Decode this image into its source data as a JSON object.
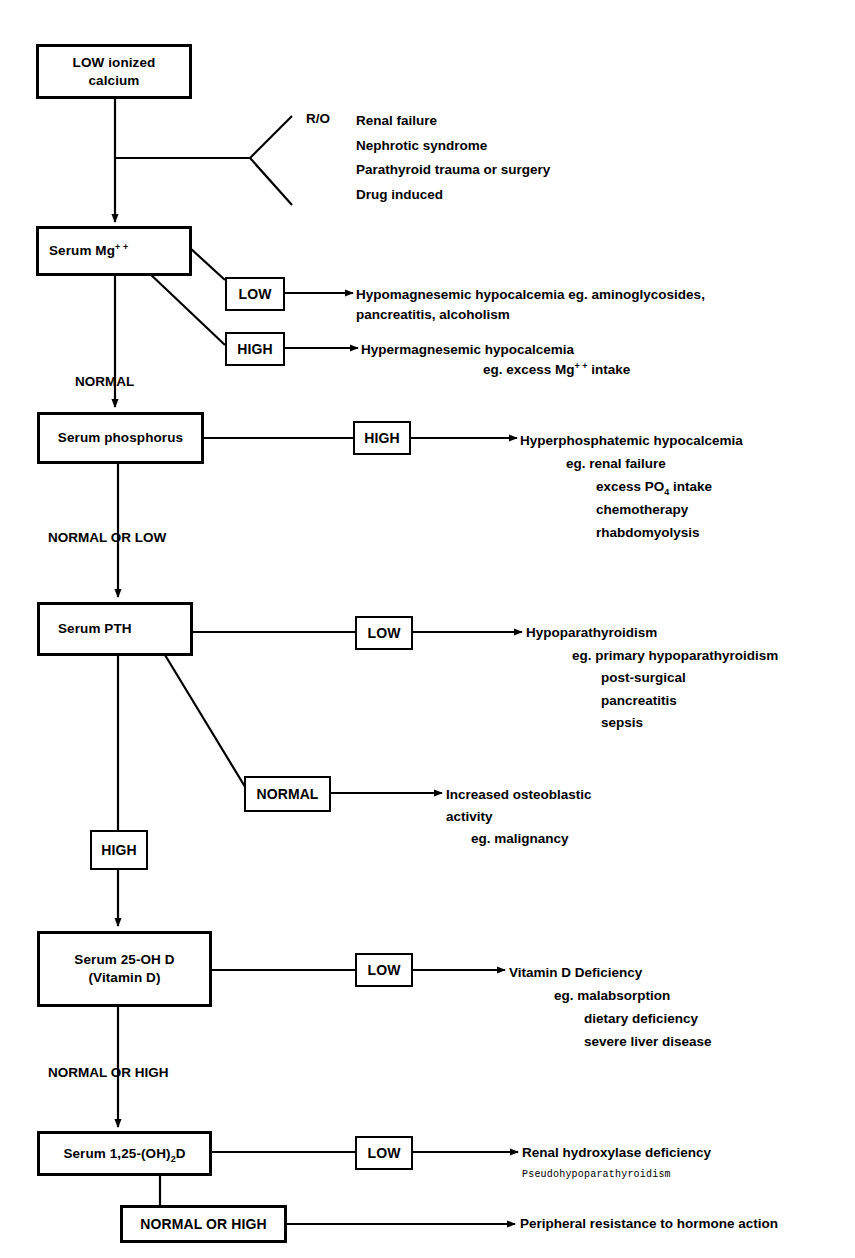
{
  "diagram": {
    "type": "flowchart",
    "nodes": {
      "start": {
        "label_lines": [
          "LOW ionized",
          "calcium"
        ]
      },
      "mg": {
        "label_main": "Serum Mg",
        "label_sup": "+ +"
      },
      "phos": {
        "label": "Serum phosphorus"
      },
      "pth": {
        "label": "Serum PTH"
      },
      "vitd": {
        "label_lines": [
          "Serum 25-OH D",
          "(Vitamin D)"
        ]
      },
      "calcitriol": {
        "label_pre": "Serum 1,25-(OH)",
        "label_sub": "2",
        "label_post": "D"
      }
    },
    "branch_boxes": {
      "mg_low": "LOW",
      "mg_high": "HIGH",
      "phos_high": "HIGH",
      "pth_low": "LOW",
      "pth_normal": "NORMAL",
      "pth_high": "HIGH",
      "vitd_low": "LOW",
      "calcitriol_low": "LOW",
      "calcitriol_normal_high": "NORMAL OR HIGH"
    },
    "edge_labels": {
      "mg_to_phos": "NORMAL",
      "phos_to_pth": "NORMAL OR LOW",
      "vitd_to_calcitriol": "NORMAL OR HIGH"
    },
    "rule_out": {
      "prefix": "R/O",
      "items": [
        "Renal failure",
        "Nephrotic syndrome",
        "Parathyroid trauma or surgery",
        "Drug induced"
      ]
    },
    "outcomes": {
      "hypomagnesemic": {
        "lines": [
          "Hypomagnesemic hypocalcemia eg. aminoglycosides,",
          "pancreatitis, alcoholism"
        ]
      },
      "hypermagnesemic": {
        "title": "Hypermagnesemic hypocalcemia",
        "eg_pre": "eg. excess Mg",
        "eg_sup": "+ +",
        "eg_post": " intake"
      },
      "hyperphosphatemic": {
        "title": "Hyperphosphatemic hypocalcemia",
        "eg_first": "eg. renal failure",
        "po4_pre": "excess PO",
        "po4_sub": "4",
        "po4_post": " intake",
        "rest": [
          "chemotherapy",
          "rhabdomyolysis"
        ]
      },
      "hypoparathyroidism": {
        "title": "Hypoparathyroidism",
        "eg_first": "eg. primary hypoparathyroidism",
        "rest": [
          "post-surgical",
          "pancreatitis",
          "sepsis"
        ]
      },
      "osteoblastic": {
        "lines": [
          "Increased osteoblastic",
          "activity"
        ],
        "eg": "eg. malignancy"
      },
      "vitd_deficiency": {
        "title": "Vitamin D Deficiency",
        "eg_first": "eg. malabsorption",
        "rest": [
          "dietary deficiency",
          "severe liver disease"
        ]
      },
      "renal_hydroxylase": {
        "title": "Renal hydroxylase deficiency",
        "note": "Pseudohypoparathyroidism"
      },
      "peripheral_resistance": {
        "title": "Peripheral resistance to hormone action"
      }
    }
  }
}
